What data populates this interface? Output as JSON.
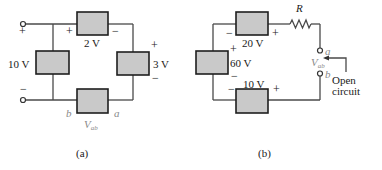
{
  "figure_a": {
    "caption": "(a)",
    "sources": {
      "left": "10 V",
      "top": "2 V",
      "right": "3 V"
    },
    "terminals": {
      "top_sign": "+",
      "bottom_sign": "−"
    },
    "polarity": {
      "top_left": "+",
      "top_right": "−",
      "right_top": "+",
      "right_bottom": "−"
    },
    "node_b": "b",
    "node_a": "a",
    "vab": {
      "main": "V",
      "sub": "ab"
    }
  },
  "figure_b": {
    "caption": "(b)",
    "sources": {
      "top": "20 V",
      "left": "60 V",
      "bottom": "10 V"
    },
    "resistor": "R",
    "polarity": {
      "top_left": "−",
      "top_right": "+",
      "left_top": "+",
      "left_bottom": "−",
      "bottom_left": "−",
      "bottom_right": "+"
    },
    "node_a": "a",
    "node_b": "b",
    "vab": {
      "main": "V",
      "sub": "ab"
    },
    "annotation_line1": "Open",
    "annotation_line2": "circuit"
  },
  "colors": {
    "box_fill": "#c9c9c9",
    "box_stroke": "#1e1e1e",
    "wire": "#4a4a4a",
    "italic_label": "#8a8a8a"
  }
}
